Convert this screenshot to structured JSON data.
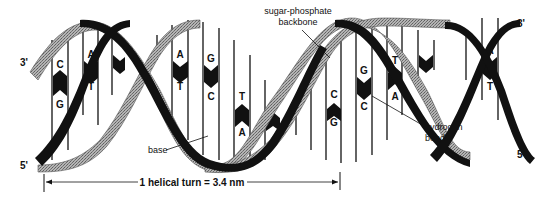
{
  "diagram": {
    "type": "dna-double-helix",
    "colors": {
      "dark_strand": "#111111",
      "light_strand": "#9a9a9a",
      "rungs": "#111111",
      "background": "#ffffff"
    },
    "strand_ends": {
      "left_top": "3'",
      "left_bottom": "5'",
      "right_top": "3'",
      "right_bottom": "5'"
    },
    "labels": {
      "backbone_line1": "sugar-phosphate",
      "backbone_line2": "backbone",
      "hydrogen_line1": "hydrogen",
      "hydrogen_line2": "bonds",
      "base": "base"
    },
    "scale_bar": {
      "text": "1 helical turn = 3.4 nm"
    },
    "base_pairs": [
      {
        "top": "C",
        "bottom": "G"
      },
      {
        "top": "A",
        "bottom": "T"
      },
      {
        "top": "A",
        "bottom": "T"
      },
      {
        "top": "G",
        "bottom": "C"
      },
      {
        "top": "T",
        "bottom": "A"
      },
      {
        "top": "C",
        "bottom": "G"
      },
      {
        "top": "G",
        "bottom": "C"
      },
      {
        "top": "T",
        "bottom": "A"
      },
      {
        "top": "A",
        "bottom": "T"
      }
    ]
  }
}
